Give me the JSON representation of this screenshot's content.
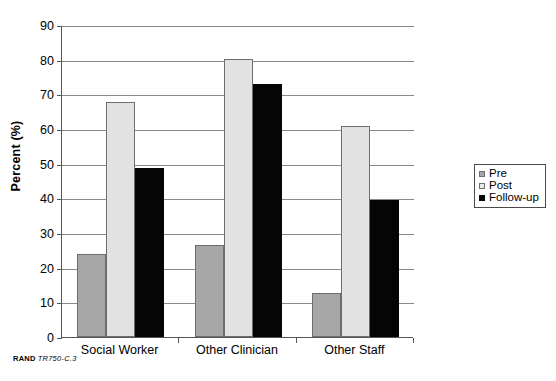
{
  "caption": {
    "org": "RAND",
    "reference": "TR750-C.3"
  },
  "legend": {
    "position": "right",
    "items": [
      {
        "label": "Pre",
        "color": "#a6a6a6",
        "swatch": "pre"
      },
      {
        "label": "Post",
        "color": "#e8e8e8",
        "swatch": "post"
      },
      {
        "label": "Follow-up",
        "color": "#050505",
        "swatch": "follow"
      }
    ]
  },
  "chart_data": {
    "type": "bar",
    "title": "",
    "xlabel": "",
    "ylabel": "Percent (%)",
    "ylim": [
      0,
      90
    ],
    "ytick_step": 10,
    "yticks": [
      0,
      10,
      20,
      30,
      40,
      50,
      60,
      70,
      80,
      90
    ],
    "grid": true,
    "categories": [
      "Social Worker",
      "Other Clinician",
      "Other Staff"
    ],
    "series": [
      {
        "name": "Pre",
        "color": "#a6a6a6",
        "values": [
          24.0,
          26.5,
          12.6
        ]
      },
      {
        "name": "Post",
        "color": "#e8e8e8",
        "values": [
          67.8,
          80.3,
          61.0
        ]
      },
      {
        "name": "Follow-up",
        "color": "#050505",
        "values": [
          48.8,
          72.9,
          39.4
        ]
      }
    ]
  }
}
